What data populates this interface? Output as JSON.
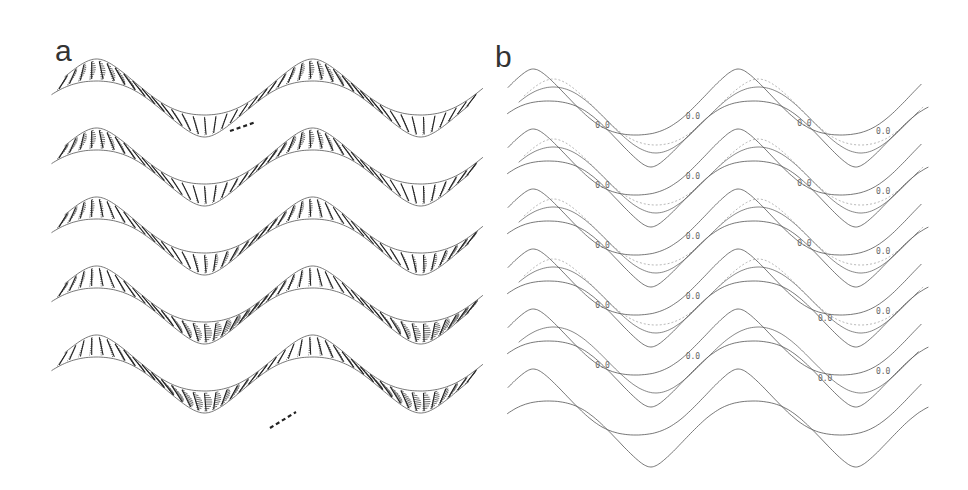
{
  "figure": {
    "panels": [
      {
        "id": "a",
        "label": "a",
        "description": "Velocity profile vectors along sinusoidal channel, 5 stacked cases",
        "channels": 5
      },
      {
        "id": "b",
        "label": "b",
        "description": "Contour plots of flow in sinusoidal channel, 6 stacked cases",
        "channels": 6,
        "contour_label": "0.0"
      }
    ],
    "colors": {
      "line": "#555555",
      "vector": "#333333",
      "background": "#ffffff"
    }
  }
}
